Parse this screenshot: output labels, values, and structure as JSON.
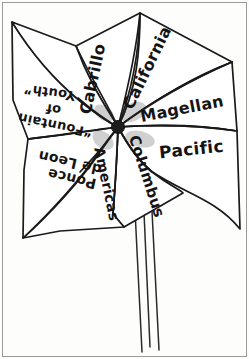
{
  "image": {
    "title": "Hand-drawn pinwheel with explorer labels",
    "medium": "black ink line drawing on white paper",
    "background_color": "#fdfdfc",
    "ink_color": "#1a1a1a",
    "frame_color": "#9a9a9a",
    "width": 249,
    "height": 359
  },
  "pinwheel": {
    "hub_label": "hub",
    "hub_color": "#1d1d1d",
    "blade_count": 6,
    "blades": [
      {
        "id": "blade-california",
        "label": "California",
        "orientation": "rotated-upright",
        "position": "upper-right"
      },
      {
        "id": "blade-magellan",
        "label": "Magellan",
        "orientation": "upright",
        "position": "right-upper"
      },
      {
        "id": "blade-pacific",
        "label": "Pacific",
        "orientation": "upright",
        "position": "right-lower"
      },
      {
        "id": "blade-columbus",
        "label": "Columbus",
        "orientation": "rotated-upright",
        "position": "lower-right"
      },
      {
        "id": "blade-americas",
        "label": "Americas",
        "orientation": "rotated-upright",
        "position": "lower-center"
      },
      {
        "id": "blade-ponce",
        "label": "Ponce de Leon",
        "orientation": "upside-down",
        "position": "lower-left"
      },
      {
        "id": "blade-fountain",
        "label": "“Fountain of Youth”",
        "orientation": "upside-down",
        "position": "left"
      },
      {
        "id": "blade-cabrillo",
        "label": "Cabrillo",
        "orientation": "rotated-upright",
        "position": "upper-left"
      }
    ],
    "blade_labels": {
      "california": "California",
      "magellan": "Magellan",
      "pacific": "Pacific",
      "columbus": "Columbus",
      "americas": "Americas",
      "ponce_line1": "Ponce",
      "ponce_line2": "de Leon",
      "fountain_line1": "“Fountain",
      "fountain_line2": "of",
      "fountain_line3": "Youth”",
      "cabrillo": "Cabrillo"
    }
  },
  "stick": {
    "label": "pinwheel stick",
    "line_count": 3,
    "color": "#2a2a2a"
  }
}
